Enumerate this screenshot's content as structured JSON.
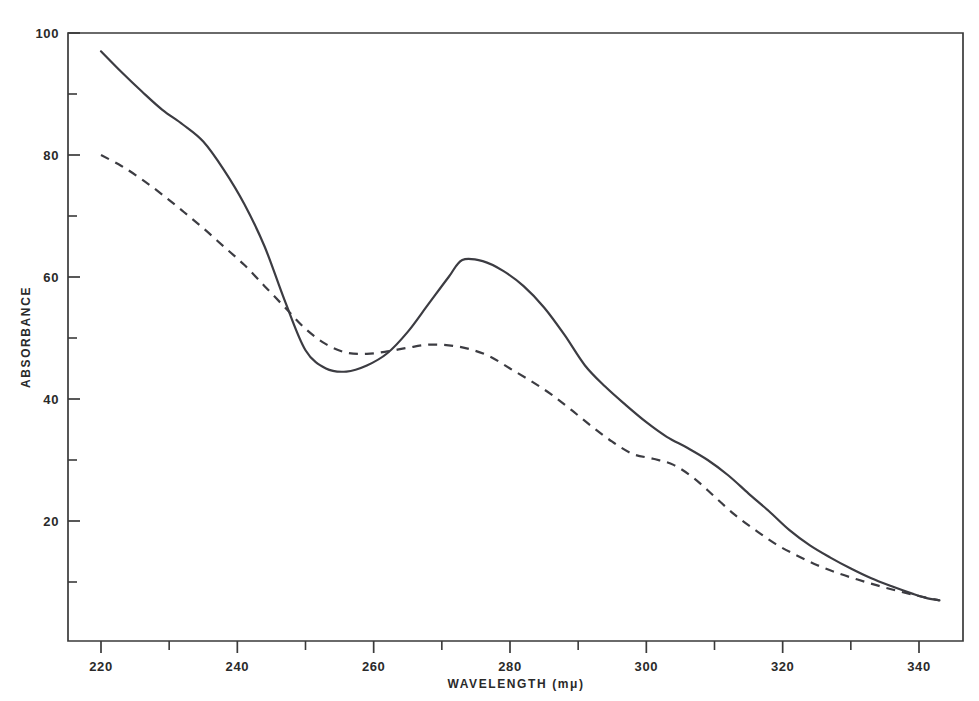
{
  "chart_data": {
    "type": "line",
    "title": "",
    "xlabel": "WAVELENGTH  (mμ)",
    "ylabel": "ABSORBANCE",
    "xlim": [
      218,
      344
    ],
    "ylim": [
      4,
      102
    ],
    "grid": false,
    "legend": "none",
    "x_ticks_major": [
      220,
      240,
      260,
      280,
      300,
      320,
      340
    ],
    "x_tick_labels": [
      "220",
      "240",
      "260",
      "280",
      "300",
      "320",
      "340"
    ],
    "x_ticks_minor": [
      230,
      250,
      270,
      290,
      310,
      330
    ],
    "y_ticks_major": [
      20,
      40,
      60,
      80,
      100
    ],
    "y_tick_labels": [
      "20",
      "40",
      "60",
      "80",
      "100"
    ],
    "y_ticks_minor": [
      10,
      30,
      50,
      70,
      90
    ],
    "series": [
      {
        "name": "solid-curve",
        "style": "solid",
        "color": "#3c3c42",
        "x": [
          220,
          223,
          226,
          229,
          232,
          235,
          238,
          241,
          244,
          247,
          250,
          253,
          256,
          259,
          262,
          265,
          268,
          271,
          273,
          276,
          279,
          282,
          285,
          288,
          291,
          294,
          297,
          300,
          303,
          306,
          309,
          312,
          315,
          318,
          321,
          324,
          327,
          330,
          333,
          336,
          339,
          341,
          343
        ],
        "y": [
          97.0,
          93.6,
          90.4,
          87.4,
          85.0,
          82.2,
          77.6,
          72.0,
          65.0,
          56.0,
          48.0,
          45.0,
          44.5,
          45.5,
          47.5,
          51.0,
          55.5,
          60.0,
          62.8,
          62.6,
          61.0,
          58.5,
          55.0,
          50.5,
          45.5,
          42.0,
          39.0,
          36.2,
          33.8,
          32.0,
          30.0,
          27.5,
          24.5,
          21.6,
          18.5,
          16.0,
          14.0,
          12.2,
          10.6,
          9.3,
          8.1,
          7.4,
          7.0
        ]
      },
      {
        "name": "dashed-curve",
        "style": "dashed",
        "color": "#3c3c42",
        "x": [
          220,
          223,
          226,
          229,
          232,
          235,
          238,
          241,
          244,
          247,
          250,
          253,
          256,
          259,
          262,
          265,
          268,
          271,
          274,
          277,
          280,
          283,
          286,
          289,
          292,
          295,
          298,
          301,
          304,
          307,
          310,
          313,
          316,
          319,
          322,
          325,
          328,
          331,
          334,
          337,
          340,
          343
        ],
        "y": [
          80.0,
          78.2,
          76.0,
          73.5,
          70.8,
          68.0,
          65.0,
          62.0,
          58.5,
          55.0,
          51.5,
          49.0,
          47.6,
          47.4,
          47.8,
          48.4,
          48.9,
          48.8,
          48.2,
          47.0,
          45.0,
          43.0,
          40.8,
          38.2,
          35.5,
          33.0,
          31.0,
          30.2,
          29.2,
          27.0,
          24.0,
          21.0,
          18.5,
          16.2,
          14.4,
          12.8,
          11.5,
          10.4,
          9.4,
          8.5,
          7.7,
          7.0
        ]
      }
    ],
    "annotations": []
  },
  "figure": {
    "frame_color": "#3a3a3a",
    "background": "#ffffff"
  }
}
